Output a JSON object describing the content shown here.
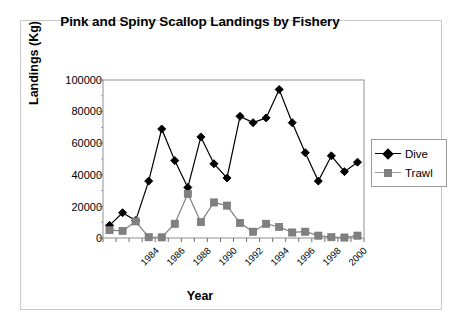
{
  "chart_data": {
    "type": "line",
    "title": "Pink and Spiny Scallop Landings by Fishery",
    "xlabel": "Year",
    "ylabel": "Landings (Kg)",
    "grid": false,
    "legend_position": "right",
    "ylim": [
      0,
      100000
    ],
    "ytick_labels": [
      "100000",
      "80000",
      "60000",
      "40000",
      "20000",
      "0"
    ],
    "ytick_values": [
      100000,
      80000,
      60000,
      40000,
      20000,
      0
    ],
    "x": [
      1983,
      1984,
      1985,
      1986,
      1987,
      1988,
      1989,
      1990,
      1991,
      1992,
      1993,
      1994,
      1995,
      1996,
      1997,
      1998,
      1999,
      2000,
      2001,
      2002
    ],
    "xtick_labels": [
      "1984",
      "1986",
      "1988",
      "1990",
      "1992",
      "1994",
      "1996",
      "1998",
      "2000"
    ],
    "xtick_values": [
      1984,
      1986,
      1988,
      1990,
      1992,
      1994,
      1996,
      1998,
      2000
    ],
    "series": [
      {
        "name": "Dive",
        "color": "#000000",
        "marker": "diamond",
        "values": [
          8000,
          16000,
          11000,
          36000,
          69000,
          49000,
          32000,
          64000,
          47000,
          38000,
          77000,
          73000,
          76000,
          94000,
          73000,
          54000,
          36000,
          52000,
          42000,
          48000
        ]
      },
      {
        "name": "Trawl",
        "color": "#808080",
        "marker": "square",
        "values": [
          5000,
          4500,
          10500,
          500,
          400,
          9000,
          28000,
          10000,
          22500,
          20500,
          9500,
          4000,
          9000,
          7000,
          3500,
          4000,
          1500,
          500,
          300,
          1500
        ]
      }
    ]
  },
  "legend": {
    "items": [
      {
        "label": "Dive"
      },
      {
        "label": "Trawl"
      }
    ]
  }
}
